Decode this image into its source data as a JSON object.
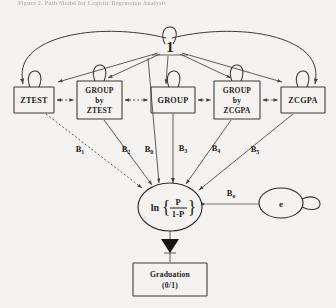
{
  "figure": {
    "caption_faint": "Figure 2. Path Model for Logistic Regression Analysis",
    "type": "path-diagram",
    "background_color": "#f4f3f1",
    "line_color": "#3d3a37",
    "text_color": "#1f1d1c"
  },
  "constant_node": {
    "label": "1",
    "name": "constant-one"
  },
  "predictor_boxes": [
    {
      "id": "ztest",
      "lines": [
        "ZTEST"
      ],
      "x": 14,
      "y": 87,
      "w": 40,
      "h": 26
    },
    {
      "id": "group-ztest",
      "lines": [
        "GROUP",
        "by",
        "ZTEST"
      ],
      "x": 77,
      "y": 81,
      "w": 45,
      "h": 38
    },
    {
      "id": "group",
      "lines": [
        "GROUP"
      ],
      "x": 151,
      "y": 87,
      "w": 44,
      "h": 26
    },
    {
      "id": "group-zcgpa",
      "lines": [
        "GROUP",
        "by",
        "ZCGPA"
      ],
      "x": 214,
      "y": 81,
      "w": 46,
      "h": 38
    },
    {
      "id": "zcgpa",
      "lines": [
        "ZCGPA"
      ],
      "x": 281,
      "y": 87,
      "w": 44,
      "h": 26
    }
  ],
  "path_coefficients": [
    {
      "id": "b1",
      "symbol": "B",
      "subscript": "1",
      "x": 80,
      "y": 152
    },
    {
      "id": "b2",
      "symbol": "B",
      "subscript": "2",
      "x": 126,
      "y": 152
    },
    {
      "id": "b0",
      "symbol": "B",
      "subscript": "0",
      "x": 149,
      "y": 152
    },
    {
      "id": "b3",
      "symbol": "B",
      "subscript": "3",
      "x": 183,
      "y": 151
    },
    {
      "id": "b4",
      "symbol": "B",
      "subscript": "4",
      "x": 216,
      "y": 151
    },
    {
      "id": "b5",
      "symbol": "B",
      "subscript": "5",
      "x": 255,
      "y": 152
    },
    {
      "id": "be",
      "symbol": "B",
      "subscript": "e",
      "x": 231,
      "y": 196
    }
  ],
  "logit_node": {
    "function": "ln",
    "numerator": "P",
    "denominator": "1-P",
    "open_brace": "{",
    "close_brace": "}"
  },
  "error_node": {
    "label": "e"
  },
  "outcome_box": {
    "lines": [
      "Graduation",
      "(0/1)"
    ]
  },
  "correlation_arrows": {
    "description": "double-headed arrows between adjacent predictor boxes",
    "count": 4
  }
}
